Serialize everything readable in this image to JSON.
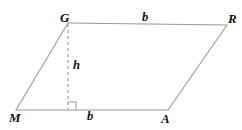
{
  "figure": {
    "kind": "geometry-diagram",
    "shape": "parallelogram",
    "width": 242,
    "height": 130,
    "background_color": "#ffffff",
    "stroke_color": "#999999",
    "stroke_width": 1,
    "dash_color": "#9a9a9a",
    "label_color": "#111111",
    "vertices": [
      {
        "id": "G",
        "label": "G",
        "x": 68,
        "y": 23
      },
      {
        "id": "R",
        "label": "R",
        "x": 227,
        "y": 25
      },
      {
        "id": "A",
        "label": "A",
        "x": 168,
        "y": 110
      },
      {
        "id": "M",
        "label": "M",
        "x": 16,
        "y": 110
      }
    ],
    "sides": [
      {
        "id": "GR",
        "from": "G",
        "to": "R",
        "style": "solid",
        "label": "b"
      },
      {
        "id": "RA",
        "from": "R",
        "to": "A",
        "style": "solid",
        "label": ""
      },
      {
        "id": "AM",
        "from": "A",
        "to": "M",
        "style": "solid",
        "label": "b"
      },
      {
        "id": "MG",
        "from": "M",
        "to": "G",
        "style": "solid",
        "label": ""
      }
    ],
    "altitude": {
      "id": "height-segment",
      "label": "h",
      "style": "dashed",
      "dash_pattern": "3 3",
      "from_x": 68,
      "from_y": 24,
      "to_x": 68,
      "to_y": 110
    },
    "right_angle_marker": {
      "id": "right-angle-marker",
      "x": 68,
      "y": 110,
      "size": 8,
      "opens": "right"
    },
    "labels": {
      "vertex_G": "G",
      "vertex_R": "R",
      "vertex_M": "M",
      "vertex_A": "A",
      "base_top": "b",
      "base_bottom": "b",
      "height": "h"
    }
  }
}
